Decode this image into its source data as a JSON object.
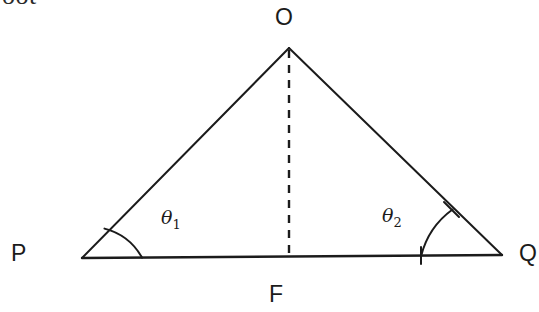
{
  "figure": {
    "kind": "geometry-diagram",
    "background_color": "#ffffff",
    "stroke_color": "#1b1b1b",
    "labels": {
      "apex": "O",
      "left_vertex": "P",
      "right_vertex": "Q",
      "foot": "F",
      "angle_left": "θ",
      "angle_left_sub": "1",
      "angle_right": "θ",
      "angle_right_sub": "2"
    },
    "cropped_text": "oot",
    "geometry": {
      "apex": [
        289,
        48
      ],
      "left_vertex": [
        82,
        258
      ],
      "right_vertex": [
        502,
        255
      ],
      "foot": [
        289,
        257
      ],
      "altitude_style": "dashed",
      "base_style": "solid",
      "left_arc": {
        "start": [
          142,
          257
        ],
        "end": [
          104,
          229
        ],
        "radius": 60
      },
      "right_arc": {
        "start": [
          421,
          256
        ],
        "end": [
          452,
          210
        ],
        "radius": 82
      },
      "right_arc_tick": {
        "from": [
          445,
          203
        ],
        "to": [
          459,
          216
        ]
      },
      "base_tick_right": {
        "from": [
          421,
          248
        ],
        "to": [
          421,
          264
        ]
      }
    }
  }
}
